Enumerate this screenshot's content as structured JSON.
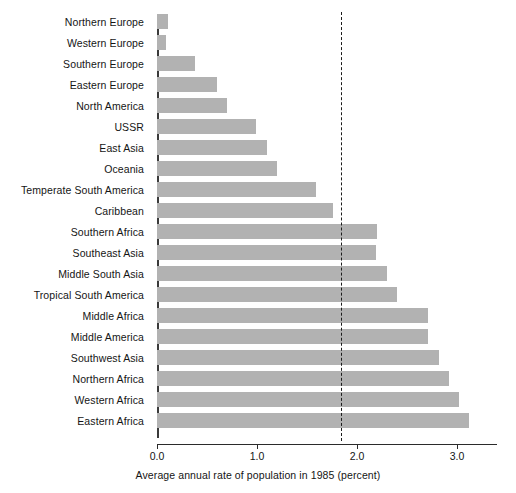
{
  "chart_data": {
    "type": "bar",
    "orientation": "horizontal",
    "title": "",
    "xlabel": "Average annual rate of population in 1985 (percent)",
    "ylabel": "",
    "xlim": [
      0.0,
      3.4
    ],
    "xticks": [
      "0.0",
      "1.0",
      "2.0",
      "3.0"
    ],
    "xtick_values": [
      0.0,
      1.0,
      2.0,
      3.0
    ],
    "grid": false,
    "legend": null,
    "bar_color": "#b2b2b2",
    "reference_line": {
      "value": 1.84,
      "style": "dashed",
      "color": "#1c1c1c",
      "label": ""
    },
    "categories": [
      "Northern Europe",
      "Western Europe",
      "Southern Europe",
      "Eastern Europe",
      "North America",
      "USSR",
      "East Asia",
      "Oceania",
      "Temperate South America",
      "Caribbean",
      "Southern Africa",
      "Southeast Asia",
      "Middle South Asia",
      "Tropical South America",
      "Middle Africa",
      "Middle America",
      "Southwest Asia",
      "Northern Africa",
      "Western Africa",
      "Eastern Africa"
    ],
    "values": [
      0.11,
      0.09,
      0.38,
      0.6,
      0.7,
      0.99,
      1.1,
      1.2,
      1.59,
      1.76,
      2.2,
      2.19,
      2.3,
      2.4,
      2.71,
      2.71,
      2.82,
      2.92,
      3.02,
      3.12
    ]
  }
}
